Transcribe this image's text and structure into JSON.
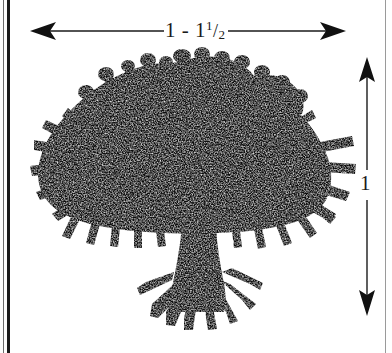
{
  "figure": {
    "type": "botanical-dimension-diagram",
    "subject_icon": "tree-silhouette",
    "background_color": "#ffffff",
    "ink_color": "#111111"
  },
  "dimensions": {
    "width": {
      "label_whole": "1",
      "label_separator": "-",
      "label_mixed_whole": "1",
      "label_frac_numerator": "1",
      "label_frac_slash": "/",
      "label_frac_denominator": "2",
      "label_plain": "1 - 1 1/2",
      "arrow_name": "horizontal-double-arrow",
      "orientation": "horizontal"
    },
    "height": {
      "label": "1",
      "arrow_name": "vertical-double-arrow",
      "orientation": "vertical"
    }
  },
  "borders": {
    "left_thin": "#6d6d6d",
    "left_thick": "#1c1c1c",
    "right_thin": "#9a9a9a"
  }
}
